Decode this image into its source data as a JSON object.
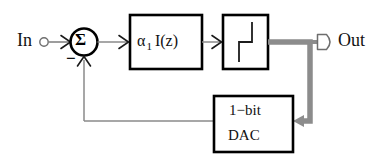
{
  "diagram": {
    "colors": {
      "line": "#808080",
      "thick_line": "#8c8c8c",
      "block_border": "#000000",
      "text": "#111111",
      "background": "#ffffff"
    },
    "labels": {
      "input": "In",
      "output": "Out",
      "summing_node": "Σ",
      "minus_sign": "−",
      "integrator_alpha": "α",
      "integrator_subscript": "1",
      "integrator_transfer": "I(z)",
      "dac_line1": "1−bit",
      "dac_line2": "DAC"
    },
    "nodes": [
      {
        "name": "input-terminal",
        "kind": "terminal-circle",
        "cx": 44,
        "cy": 42,
        "r": 4
      },
      {
        "name": "summing-junction",
        "kind": "circle",
        "cx": 84,
        "cy": 42,
        "r": 14
      },
      {
        "name": "integrator-block",
        "kind": "rect",
        "x": 129,
        "y": 14,
        "w": 74,
        "h": 56
      },
      {
        "name": "quantizer-block",
        "kind": "rect",
        "x": 222,
        "y": 14,
        "w": 46,
        "h": 56
      },
      {
        "name": "dac-block",
        "kind": "rect",
        "x": 213,
        "y": 95,
        "w": 80,
        "h": 57
      },
      {
        "name": "output-terminal",
        "kind": "pennant",
        "x": 316,
        "y": 42
      }
    ],
    "edges": [
      {
        "name": "input-to-sum",
        "from": "input-terminal",
        "to": "summing-junction",
        "style": "thin",
        "arrow": true
      },
      {
        "name": "sum-to-integrator",
        "from": "summing-junction",
        "to": "integrator-block",
        "style": "thin",
        "arrow": true
      },
      {
        "name": "integrator-to-quantizer",
        "from": "integrator-block",
        "to": "quantizer-block",
        "style": "thin",
        "arrow": true
      },
      {
        "name": "quantizer-to-output",
        "from": "quantizer-block",
        "to": "output-terminal",
        "style": "thick",
        "arrow": false
      },
      {
        "name": "output-to-dac",
        "from": "output-tap",
        "to": "dac-block",
        "style": "thick",
        "arrow": true
      },
      {
        "name": "dac-to-sum",
        "from": "dac-block",
        "to": "summing-junction",
        "style": "thin",
        "arrow": true
      }
    ]
  }
}
